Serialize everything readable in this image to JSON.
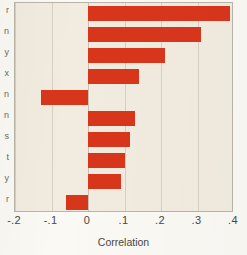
{
  "figure": {
    "background_color": "#fbf9f4",
    "plot_background_color": "#f2ece0",
    "bar_color": "#d8361b",
    "gridline_color": "#d6d0c2"
  },
  "cropped_labels": [
    {
      "letter": "r"
    },
    {
      "letter": "n"
    },
    {
      "letter": "y"
    },
    {
      "letter": "x"
    },
    {
      "letter": "n"
    },
    {
      "letter": "n"
    },
    {
      "letter": "s"
    },
    {
      "letter": "t"
    },
    {
      "letter": "y"
    },
    {
      "letter": "r"
    }
  ],
  "chart_data": {
    "type": "bar",
    "orientation": "horizontal",
    "title": "",
    "xlabel": "Correlation",
    "ylabel": "",
    "xlim": [
      -0.2,
      0.4
    ],
    "xticks": [
      -0.2,
      -0.1,
      0,
      0.1,
      0.2,
      0.3,
      0.4
    ],
    "xtick_labels": [
      "-.2",
      "-.1",
      "0",
      ".1",
      ".2",
      ".3",
      ".4"
    ],
    "grid": true,
    "legend": "none",
    "categories": [
      "bar-1",
      "bar-2",
      "bar-3",
      "bar-4",
      "bar-5",
      "bar-6",
      "bar-7",
      "bar-8",
      "bar-9",
      "bar-10"
    ],
    "values": [
      0.39,
      0.31,
      0.21,
      0.14,
      -0.13,
      0.13,
      0.115,
      0.1,
      0.09,
      -0.06
    ]
  }
}
